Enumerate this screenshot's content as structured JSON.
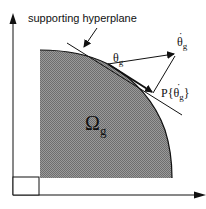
{
  "diagram": {
    "annotation": "supporting hyperplane",
    "region_label": "Ω",
    "region_subscript": "g",
    "point_label": "θ",
    "point_subscript": "g",
    "velocity_label": "θ",
    "velocity_subscript": "g",
    "projection_prefix": "P{θ",
    "projection_subscript": "g",
    "projection_suffix": "}",
    "dot": "·",
    "colors": {
      "region_fill": "#8a8a8a",
      "stroke": "#111111",
      "background": "#ffffff"
    }
  }
}
